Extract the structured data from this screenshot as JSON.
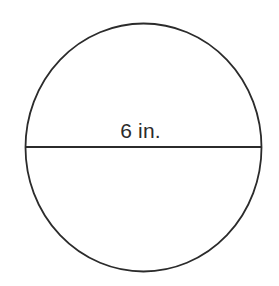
{
  "figure": {
    "kind": "geometry-diagram",
    "shape_name": "circle",
    "background_color": "#ffffff",
    "stroke_color": "#2b2b2b",
    "text_color": "#2b2b2b",
    "labels": {
      "diameter": "6 in."
    },
    "measurements": {
      "diameter_value": 6,
      "diameter_unit": "in."
    },
    "geometry": {
      "circle_center_x": 143.5,
      "circle_center_y": 147.5,
      "circle_radius_x": 118,
      "circle_radius_y": 124,
      "diameter_line_y": 147,
      "diameter_line_x_start": 25.5,
      "diameter_line_x_end": 261.5,
      "stroke_width": 1.8
    }
  }
}
